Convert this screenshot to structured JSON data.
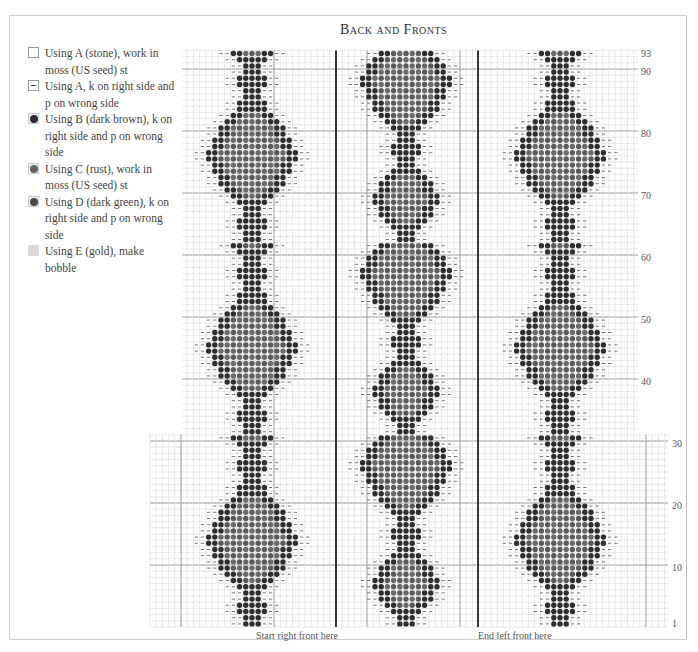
{
  "title": "Back and Fronts",
  "legend": [
    {
      "symbol": "empty",
      "color": "#ffffff",
      "text": "Using A (stone), work in moss (US seed) st"
    },
    {
      "symbol": "dash",
      "color": "#444444",
      "text": "Using A, k on right side and p on wrong side"
    },
    {
      "symbol": "dot",
      "color": "#2e2e2e",
      "text": "Using B (dark brown), k on right side and p on wrong side"
    },
    {
      "symbol": "dot",
      "color": "#666666",
      "text": "Using C (rust), work in moss (US seed) st"
    },
    {
      "symbol": "dot",
      "color": "#4a4a4a",
      "text": "Using D (dark green), k on right side and p on wrong side"
    },
    {
      "symbol": "gold",
      "color": "#d4d4d4",
      "text": "Using E (gold), make bobble"
    }
  ],
  "row_labels": [
    {
      "label": "93",
      "row": 93
    },
    {
      "label": "90",
      "row": 90
    },
    {
      "label": "80",
      "row": 80
    },
    {
      "label": "70",
      "row": 70
    },
    {
      "label": "60",
      "row": 60
    },
    {
      "label": "50",
      "row": 50
    },
    {
      "label": "40",
      "row": 40
    },
    {
      "label": "30",
      "row": 30
    },
    {
      "label": "20",
      "row": 20
    },
    {
      "label": "10",
      "row": 10
    },
    {
      "label": "1",
      "row": 1
    }
  ],
  "captions": {
    "start": "Start right front here",
    "end": "End left front here"
  },
  "chart_data": {
    "type": "knitting-chart",
    "title": "Back and Fronts",
    "rows": 93,
    "row_label_ticks": [
      1,
      10,
      20,
      30,
      40,
      50,
      60,
      70,
      80,
      90,
      93
    ],
    "motif_columns": 3,
    "markers": [
      "Start right front here",
      "End left front here"
    ],
    "symbols": [
      "A stone moss",
      "A k/p dash",
      "B dark brown",
      "C rust",
      "D dark green",
      "E gold bobble"
    ]
  },
  "colors": {
    "grid_minor": "#d6d6d6",
    "grid_major": "#9a9a9a",
    "grid_thick": "#222222",
    "dot_dark": "#2e2e2e",
    "dot_mid": "#6a6a6a",
    "dash": "#555555"
  }
}
